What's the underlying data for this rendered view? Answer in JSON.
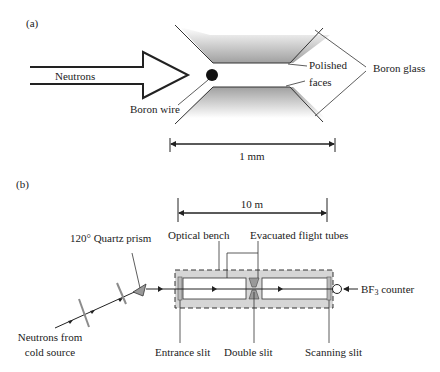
{
  "panel_a": {
    "label": "(a)",
    "beam_label": "Neutrons",
    "wire_label": "Boron wire",
    "polished_label_1": "Polished",
    "polished_label_2": "faces",
    "glass_label": "Boron glass",
    "scale_label": "1 mm"
  },
  "panel_b": {
    "label": "(b)",
    "scale_label": "10 m",
    "prism_label": "120° Quartz prism",
    "bench_label": "Optical bench",
    "tubes_label": "Evacuated flight tubes",
    "counter_label_prefix": "BF",
    "counter_label_sub": "3",
    "counter_label_suffix": " counter",
    "source_label_1": "Neutrons from",
    "source_label_2": "cold source",
    "entrance_label": "Entrance slit",
    "double_label": "Double slit",
    "scanning_label": "Scanning slit"
  },
  "colors": {
    "line": "#222222",
    "glass_shade": "#9a9a9a",
    "bench_fill": "#d6d6d6",
    "filter": "#8c8c8c"
  }
}
